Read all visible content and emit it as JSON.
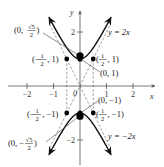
{
  "figure": {
    "type": "hyperbola-graph",
    "equation": "y^2 - 4x^2 = 1",
    "axes": {
      "x_label": "x",
      "y_label": "y",
      "x_range": [
        -2.7,
        2.8
      ],
      "y_range": [
        -2.9,
        2.7
      ],
      "x_ticks": [
        {
          "value": -2,
          "label": "−2"
        },
        {
          "value": -1,
          "label": "−1"
        },
        {
          "value": 1,
          "label": "1"
        },
        {
          "value": 2,
          "label": "2"
        }
      ],
      "y_ticks": [
        {
          "value": 2,
          "label": "2"
        },
        {
          "value": -2,
          "label": "−2"
        }
      ],
      "origin_label": "0"
    },
    "asymptotes": [
      {
        "label": "y = 2x",
        "slope": 2
      },
      {
        "label": "y = −2x",
        "slope": -2
      }
    ],
    "curve_x_extent": 1.17,
    "vertices": [
      {
        "x": 0,
        "y": 1,
        "label": "(0, 1)"
      },
      {
        "x": 0,
        "y": -1,
        "label": "(0, −1)"
      }
    ],
    "foci": [
      {
        "x": 0,
        "y": 1.118,
        "label_prefix": "(0, ",
        "label_num": "√5",
        "label_den": "2",
        "label_suffix": ")"
      },
      {
        "x": 0,
        "y": -1.118,
        "label_prefix": "(0, −",
        "label_num": "√5",
        "label_den": "2",
        "label_suffix": ")"
      }
    ],
    "box_points": [
      {
        "x": -0.5,
        "y": 1,
        "label_prefix": "(−",
        "label_num": "1",
        "label_den": "2",
        "label_suffix": ", 1)"
      },
      {
        "x": 0.5,
        "y": 1,
        "label_prefix": "(",
        "label_num": "1",
        "label_den": "2",
        "label_suffix": ", 1)"
      },
      {
        "x": -0.5,
        "y": -1,
        "label_prefix": "(−",
        "label_num": "1",
        "label_den": "2",
        "label_suffix": ", −1)"
      },
      {
        "x": 0.5,
        "y": -1,
        "label_prefix": "(",
        "label_num": "1",
        "label_den": "2",
        "label_suffix": ", −1)"
      }
    ],
    "colors": {
      "curve": "#111111",
      "axis": "#555555",
      "dashed": "#777777",
      "point": "#000000"
    }
  }
}
